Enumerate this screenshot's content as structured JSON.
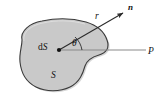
{
  "figure": {
    "caption_present": false,
    "background_color": "#ffffff",
    "surface": {
      "name": "surface-region",
      "fill_color": "#c9c9c9",
      "stroke_color": "#3a3a3a",
      "label": "S"
    },
    "area_element": {
      "name": "area-element",
      "label": "dS",
      "label_prefix": "d",
      "label_symbol": "S",
      "point_color": "#111111"
    },
    "normal_vector": {
      "name": "normal-vector",
      "label": "n",
      "stroke_color": "#2b2b2b",
      "arrowhead": true
    },
    "radius_vector": {
      "name": "radius-vector",
      "label": "r",
      "stroke_color": "#2b2b2b"
    },
    "angle": {
      "name": "angle-theta",
      "label": "θ",
      "arc_color": "#2b2b2b"
    },
    "ray_to_point": {
      "name": "ray-to-point",
      "stroke_color": "#8a8a8a"
    },
    "point_p": {
      "name": "point-p",
      "label": "P"
    }
  }
}
